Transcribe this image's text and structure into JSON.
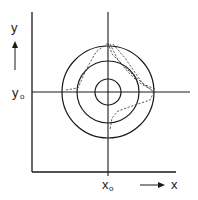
{
  "labels": {
    "y_axis": "y",
    "y_origin": "y",
    "y_origin_sub": "o",
    "x_origin": "x",
    "x_origin_sub": "o",
    "x_axis": "x"
  },
  "colors": {
    "stroke": "#1a1a1a",
    "background": "#ffffff"
  },
  "geometry": {
    "center": [
      108,
      92
    ],
    "circle_radii": [
      13,
      31,
      46
    ]
  }
}
